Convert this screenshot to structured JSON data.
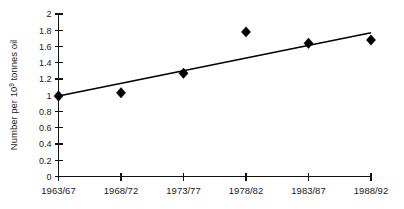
{
  "chart_data": {
    "type": "scatter",
    "title": "",
    "xlabel": "",
    "ylabel": "Number per 10⁹ tonnes oil",
    "ylabel_base": "Number per 10",
    "ylabel_superscript": "9",
    "ylabel_tail": " tonnes oil",
    "categories": [
      "1963/67",
      "1968/72",
      "1973/77",
      "1978/82",
      "1983/87",
      "1988/92"
    ],
    "values": [
      0.99,
      1.03,
      1.27,
      1.78,
      1.64,
      1.68
    ],
    "series": [
      {
        "name": "Number per 10^9 tonnes oil",
        "marker": "diamond",
        "values": [
          0.99,
          1.03,
          1.27,
          1.78,
          1.64,
          1.68
        ]
      },
      {
        "name": "Linear trend",
        "type": "line",
        "endpoints": [
          {
            "x_index": 0,
            "y": 0.99
          },
          {
            "x_index": 5,
            "y": 1.77
          }
        ]
      }
    ],
    "ylim": [
      0,
      2
    ],
    "ytick_labels": [
      "0",
      "0.2",
      "0.4",
      "0.6",
      "0.8",
      "1",
      "1.2",
      "1.4",
      "1.6",
      "1.8",
      "2"
    ],
    "ytick_values": [
      0,
      0.2,
      0.4,
      0.6,
      0.8,
      1,
      1.2,
      1.4,
      1.6,
      1.8,
      2
    ],
    "xtick_labels": [
      "1963/67",
      "1968/72",
      "1973/77",
      "1978/82",
      "1983/87",
      "1988/92"
    ],
    "grid": false,
    "legend": false,
    "legend_position": "none",
    "colors": {
      "marker": "#000000",
      "trend_line": "#000000",
      "axis": "#111111",
      "text": "#1a1a1a",
      "background": "#ffffff"
    }
  }
}
